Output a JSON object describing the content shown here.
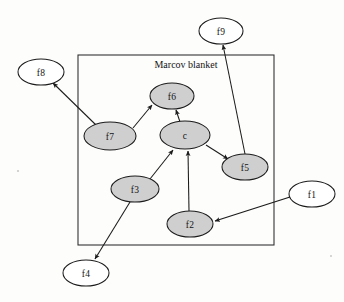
{
  "figure": {
    "type": "directed-graph-diagram",
    "title": "Marcov blanket",
    "background_color": "#fdfdfc",
    "node_fill_shaded": "#cfcfcf",
    "node_fill_open": "#ffffff",
    "stroke_color": "#1b1b1b"
  },
  "blanket": {
    "label": "Marcov blanket",
    "label_x": 186,
    "label_y": 64,
    "rect": {
      "x": 78,
      "y": 55,
      "width": 196,
      "height": 190
    }
  },
  "nodes": [
    {
      "id": "f8",
      "label": "f8",
      "cx": 41,
      "cy": 72,
      "rx": 23,
      "ry": 13,
      "shaded": false,
      "inside_blanket": false
    },
    {
      "id": "f9",
      "label": "f9",
      "cx": 221,
      "cy": 31,
      "rx": 22,
      "ry": 13,
      "shaded": false,
      "inside_blanket": false
    },
    {
      "id": "f6",
      "label": "f6",
      "cx": 172,
      "cy": 96,
      "rx": 22,
      "ry": 13,
      "shaded": true,
      "inside_blanket": true
    },
    {
      "id": "f7",
      "label": "f7",
      "cx": 110,
      "cy": 136,
      "rx": 26,
      "ry": 14,
      "shaded": true,
      "inside_blanket": true
    },
    {
      "id": "c",
      "label": "c",
      "cx": 185,
      "cy": 135,
      "rx": 25,
      "ry": 14,
      "shaded": true,
      "inside_blanket": true
    },
    {
      "id": "f5",
      "label": "f5",
      "cx": 245,
      "cy": 167,
      "rx": 23,
      "ry": 13,
      "shaded": true,
      "inside_blanket": true
    },
    {
      "id": "f3",
      "label": "f3",
      "cx": 135,
      "cy": 189,
      "rx": 24,
      "ry": 13,
      "shaded": true,
      "inside_blanket": true
    },
    {
      "id": "f2",
      "label": "f2",
      "cx": 190,
      "cy": 224,
      "rx": 23,
      "ry": 13,
      "shaded": true,
      "inside_blanket": true
    },
    {
      "id": "f1",
      "label": "f1",
      "cx": 312,
      "cy": 194,
      "rx": 23,
      "ry": 13,
      "shaded": false,
      "inside_blanket": false
    },
    {
      "id": "f4",
      "label": "f4",
      "cx": 86,
      "cy": 273,
      "rx": 23,
      "ry": 13,
      "shaded": false,
      "inside_blanket": false
    }
  ],
  "edges": [
    {
      "id": "e-f7-f8",
      "from": "f7",
      "to": "f8",
      "x1": 96,
      "y1": 125,
      "x2": 53,
      "y2": 83,
      "arrowhead": "to"
    },
    {
      "id": "e-f7-f6",
      "from": "f7",
      "to": "f6",
      "x1": 133,
      "y1": 128,
      "x2": 152,
      "y2": 105,
      "arrowhead": "to"
    },
    {
      "id": "e-c-f6",
      "from": "c",
      "to": "f6",
      "x1": 180,
      "y1": 122,
      "x2": 176,
      "y2": 110,
      "arrowhead": "to"
    },
    {
      "id": "e-c-f5",
      "from": "c",
      "to": "f5",
      "x1": 206,
      "y1": 145,
      "x2": 228,
      "y2": 159,
      "arrowhead": "to"
    },
    {
      "id": "e-f5-f9",
      "from": "f5",
      "to": "f9",
      "x1": 245,
      "y1": 154,
      "x2": 223,
      "y2": 45,
      "arrowhead": "to"
    },
    {
      "id": "e-f3-c",
      "from": "f3",
      "to": "c",
      "x1": 150,
      "y1": 179,
      "x2": 173,
      "y2": 150,
      "arrowhead": "to"
    },
    {
      "id": "e-f2-c",
      "from": "f2",
      "to": "c",
      "x1": 189,
      "y1": 211,
      "x2": 188,
      "y2": 151,
      "arrowhead": "to"
    },
    {
      "id": "e-f1-f2",
      "from": "f1",
      "to": "f2",
      "x1": 290,
      "y1": 197,
      "x2": 215,
      "y2": 221,
      "arrowhead": "to"
    },
    {
      "id": "e-f3-f4",
      "from": "f3",
      "to": "f4",
      "x1": 130,
      "y1": 202,
      "x2": 95,
      "y2": 259,
      "arrowhead": "to"
    }
  ]
}
